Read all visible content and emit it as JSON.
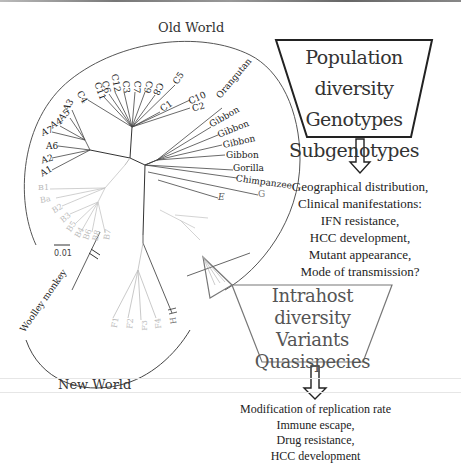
{
  "figure": {
    "regions": {
      "old_world": "Old World",
      "new_world": "New World"
    },
    "scale_bar": "0.01",
    "tree_labels": {
      "genotype_a": [
        "A3",
        "A5",
        "A4",
        "A7",
        "A6",
        "A2",
        "A1"
      ],
      "genotype_c": [
        "C4",
        "C11",
        "C6",
        "C12",
        "C3",
        "C7",
        "C9",
        "C8",
        "C5",
        "C1",
        "C10",
        "C2"
      ],
      "genotype_b": [
        "B1",
        "Ba",
        "B2",
        "B3",
        "B5",
        "B4",
        "B6",
        "B8",
        "B7"
      ],
      "genotype_f": [
        "F1",
        "F2",
        "F3",
        "F4"
      ],
      "genotype_h": [
        "H"
      ],
      "genotypes_other": [
        "E",
        "G"
      ],
      "primates": [
        "Orangutan",
        "Gibbon",
        "Gibbon",
        "Gibbon",
        "Gibbon",
        "Gorilla",
        "Chimpanzee"
      ],
      "new_world_primate": "Woolley monkey"
    },
    "box_population": {
      "lines": [
        "Population diversity",
        "Genotypes",
        "Subgenotypes"
      ]
    },
    "population_outcomes": [
      "Geographical distribution,",
      "Clinical manifestations:",
      "IFN resistance,",
      "HCC development,",
      "Mutant appearance,",
      "Mode of transmission?"
    ],
    "box_intrahost": {
      "lines": [
        "Intrahost",
        "diversity",
        "Variants",
        "Quasispecies"
      ]
    },
    "intrahost_outcomes": [
      "Modification of replication rate",
      "Immune escape,",
      "Drug resistance,",
      "HCC development"
    ],
    "colors": {
      "dark_line": "#333333",
      "faint_line": "#bbbbbb",
      "box_border": "#222222",
      "box2_border": "#777777"
    }
  }
}
